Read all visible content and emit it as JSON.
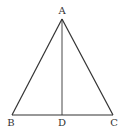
{
  "figure": {
    "type": "isosceles-triangle-with-altitude",
    "stroke_color": "#333333",
    "background": "#ffffff",
    "vertices": {
      "A": {
        "label": "A",
        "x": 62,
        "y": 19
      },
      "B": {
        "label": "B",
        "x": 12,
        "y": 115
      },
      "C": {
        "label": "C",
        "x": 113,
        "y": 115
      },
      "D": {
        "label": "D",
        "x": 62,
        "y": 115
      }
    },
    "segments": [
      "AB",
      "AC",
      "BC",
      "AD"
    ]
  }
}
